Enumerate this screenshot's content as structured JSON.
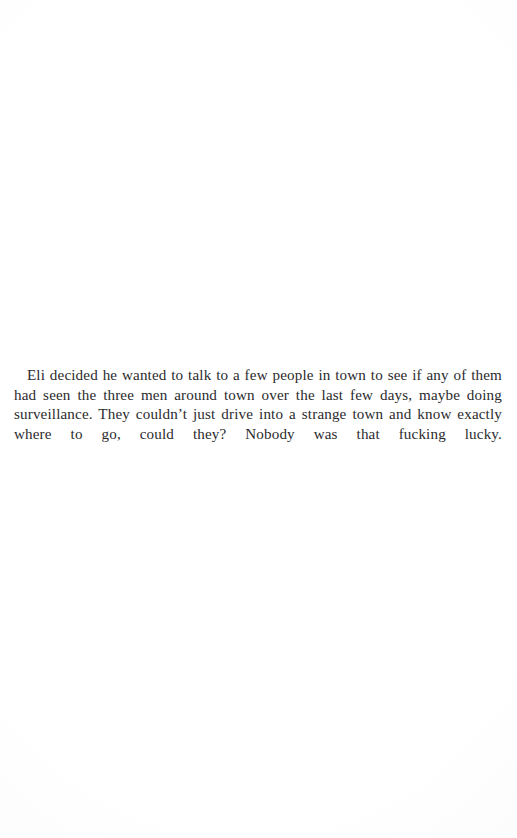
{
  "page": {
    "type": "book-page-scan",
    "width": 517,
    "height": 838,
    "background_color": "#fdfdfd",
    "text_color": "#2b2b2d",
    "header_text": "",
    "footer_text": "",
    "page_number": "",
    "running_head": ""
  },
  "content": {
    "paragraphs": [
      {
        "id": "p1",
        "text": "Eli decided he wanted to talk to a few people in town to see if any of them had seen the three men around town over the last few days, maybe doing surveillance. They couldn’t just drive into a strange town and know exactly where to go, could they? Nobody was that fucking lucky.",
        "alignment": "justified",
        "first_line_indent": true,
        "lines": [
          "Eli decided he wanted to talk to a few people in town to see if",
          "any of them had seen the three men around town over the last few",
          "days, maybe doing surveillance. They couldn’t just drive into a",
          "strange town and know exactly where to go, could they? Nobody",
          "was that fucking lucky."
        ]
      }
    ]
  }
}
